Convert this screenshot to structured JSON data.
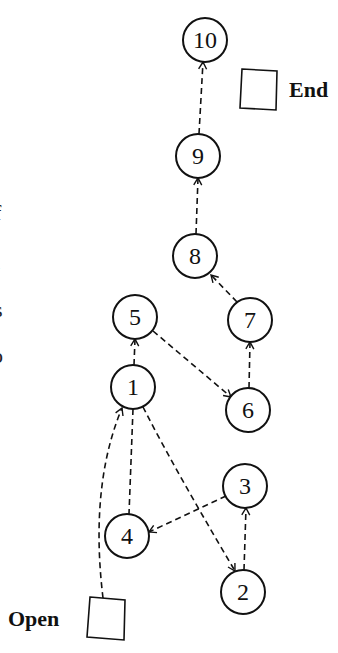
{
  "diagram": {
    "type": "directed-graph",
    "nodes": [
      {
        "id": "10",
        "label": "10",
        "cx": 205,
        "cy": 40
      },
      {
        "id": "9",
        "label": "9",
        "cx": 198,
        "cy": 156
      },
      {
        "id": "8",
        "label": "8",
        "cx": 195,
        "cy": 256
      },
      {
        "id": "5",
        "label": "5",
        "cx": 135,
        "cy": 317
      },
      {
        "id": "7",
        "label": "7",
        "cx": 250,
        "cy": 320
      },
      {
        "id": "1",
        "label": "1",
        "cx": 133,
        "cy": 387
      },
      {
        "id": "6",
        "label": "6",
        "cx": 248,
        "cy": 410
      },
      {
        "id": "3",
        "label": "3",
        "cx": 245,
        "cy": 486
      },
      {
        "id": "4",
        "label": "4",
        "cx": 127,
        "cy": 536
      },
      {
        "id": "2",
        "label": "2",
        "cx": 243,
        "cy": 592
      }
    ],
    "edges": [
      {
        "from": "Open",
        "to": "1",
        "style": "dashed",
        "arrow": true
      },
      {
        "from": "1",
        "to": "4",
        "style": "dashed",
        "arrow": false
      },
      {
        "from": "1",
        "to": "2",
        "style": "dashed",
        "arrow": true
      },
      {
        "from": "2",
        "to": "3",
        "style": "dashed",
        "arrow": true
      },
      {
        "from": "3",
        "to": "4",
        "style": "dashed",
        "arrow": true
      },
      {
        "from": "1",
        "to": "5",
        "style": "dashed",
        "arrow": true
      },
      {
        "from": "5",
        "to": "6",
        "style": "dashed",
        "arrow": true
      },
      {
        "from": "6",
        "to": "7",
        "style": "dashed",
        "arrow": true
      },
      {
        "from": "7",
        "to": "8",
        "style": "dashed",
        "arrow": true
      },
      {
        "from": "8",
        "to": "9",
        "style": "dashed",
        "arrow": true
      },
      {
        "from": "9",
        "to": "10",
        "style": "dashed",
        "arrow": true
      }
    ],
    "end_marker": {
      "label": "End"
    },
    "open_marker": {
      "label": "Open"
    }
  },
  "clipped_text": {
    "lines": [
      "f",
      "l",
      "s",
      "o"
    ]
  },
  "colors": {
    "stroke": "#111111",
    "background": "#ffffff"
  }
}
